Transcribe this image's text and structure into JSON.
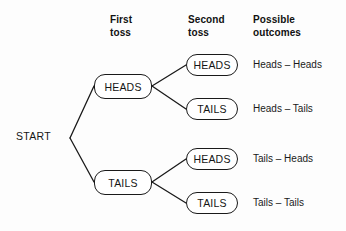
{
  "diagram": {
    "background_color": "#fdfdfd",
    "line_color": "#1a1a1a",
    "text_color": "#151515"
  },
  "headers": {
    "first_toss": "First\ntoss",
    "second_toss": "Second\ntoss",
    "possible_outcomes": "Possible\noutcomes"
  },
  "start": {
    "label": "START"
  },
  "first_toss_nodes": [
    {
      "label": "HEADS"
    },
    {
      "label": "TAILS"
    }
  ],
  "second_toss_nodes": [
    {
      "label": "HEADS"
    },
    {
      "label": "TAILS"
    },
    {
      "label": "HEADS"
    },
    {
      "label": "TAILS"
    }
  ],
  "outcomes": [
    {
      "label": "Heads – Heads"
    },
    {
      "label": "Heads – Tails"
    },
    {
      "label": "Tails – Heads"
    },
    {
      "label": "Tails – Tails"
    }
  ]
}
